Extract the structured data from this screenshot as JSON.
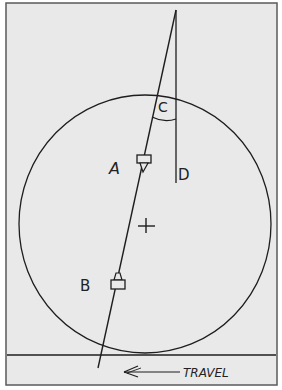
{
  "diagram": {
    "labels": {
      "c": "C",
      "a": "A",
      "d": "D",
      "b": "B",
      "travel": "TRAVEL"
    },
    "colors": {
      "paper": "#e9e9e9",
      "ink": "#1e1e1e",
      "frame": "#5a5a5a"
    },
    "elements": [
      "wheel-circle",
      "center-cross",
      "slanted-line",
      "vertical-reference-line",
      "angle-arc-c",
      "sensor-a",
      "sensor-b",
      "ground-line",
      "travel-arrow"
    ]
  }
}
